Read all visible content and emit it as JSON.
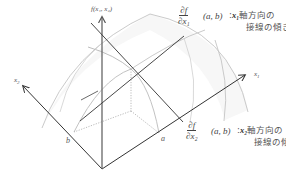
{
  "diagram": {
    "type": "3d-surface-partial-derivatives",
    "axes": {
      "x1": {
        "label": "x",
        "subscript": "1"
      },
      "x2": {
        "label": "x",
        "subscript": "2"
      },
      "f": {
        "label": "f(x₁, x₂)"
      }
    },
    "points": {
      "a": {
        "label": "a"
      },
      "b": {
        "label": "b"
      }
    },
    "annotations": [
      {
        "id": "df-dx1",
        "numerator": "∂f",
        "denominator": "∂x₁",
        "args": "(a, b)",
        "separator": ":",
        "var": "x₁",
        "line1": "軸方向の",
        "line2": "接線の傾き"
      },
      {
        "id": "df-dx2",
        "numerator": "∂f",
        "denominator": "∂x₂",
        "args": "(a, b)",
        "separator": ":",
        "var": "x₂",
        "line1": "軸方向の",
        "line2": "接線の傾き"
      }
    ],
    "colors": {
      "axis": "#333333",
      "surface_edge": "#bbbbbb",
      "tangent": "#333333",
      "dotted": "#aaaaaa",
      "f_axis": "#666666"
    }
  }
}
